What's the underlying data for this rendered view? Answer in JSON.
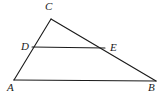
{
  "figure": {
    "type": "geometry-diagram",
    "canvas": {
      "width": 164,
      "height": 97
    },
    "background_color": "#ffffff",
    "stroke_color": "#1a1a1a",
    "stroke_width": 1.1,
    "label_color": "#1a1a1a",
    "points": [
      {
        "id": "A",
        "label": "A",
        "x": 14,
        "y": 80,
        "label_x": 7,
        "label_y": 82
      },
      {
        "id": "B",
        "label": "B",
        "x": 156,
        "y": 81,
        "label_x": 148,
        "label_y": 82
      },
      {
        "id": "C",
        "label": "C",
        "x": 51,
        "y": 19,
        "label_x": 45,
        "label_y": 1
      },
      {
        "id": "D",
        "label": "D",
        "x": 32,
        "y": 47,
        "label_x": 21,
        "label_y": 41
      },
      {
        "id": "E",
        "label": "E",
        "x": 104,
        "y": 48,
        "label_x": 110,
        "label_y": 42
      }
    ],
    "segments": [
      {
        "id": "AB",
        "from": "A",
        "to": "B",
        "name": "base-segment-ab"
      },
      {
        "id": "AC",
        "from": "A",
        "to": "C",
        "name": "side-segment-ac"
      },
      {
        "id": "CB",
        "from": "C",
        "to": "B",
        "name": "side-segment-cb"
      },
      {
        "id": "DE",
        "from": "D",
        "to": "E",
        "name": "midline-segment-de"
      }
    ]
  }
}
